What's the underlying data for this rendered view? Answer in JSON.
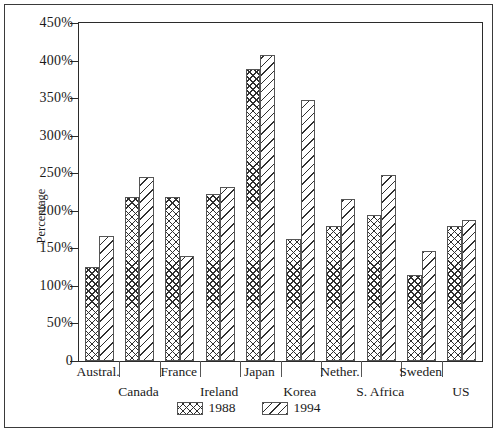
{
  "chart_data": {
    "type": "bar",
    "title": "",
    "xlabel": "",
    "ylabel": "Percentage",
    "ylim": [
      0,
      450
    ],
    "ytick_values": [
      0,
      50,
      100,
      150,
      200,
      250,
      300,
      350,
      400,
      450
    ],
    "ytick_labels": [
      "0",
      "50%",
      "100%",
      "150%",
      "200%",
      "250%",
      "300%",
      "350%",
      "400%",
      "450%"
    ],
    "grid": false,
    "legend_position": "bottom-center",
    "categories": [
      "Austral.",
      "Canada",
      "France",
      "Ireland",
      "Japan",
      "Korea",
      "Nether.",
      "S. Africa",
      "Sweden",
      "US"
    ],
    "series": [
      {
        "name": "1988",
        "hatch": "cross-hatch",
        "values": [
          125,
          219,
          219,
          222,
          389,
          162,
          180,
          194,
          114,
          180
        ]
      },
      {
        "name": "1994",
        "hatch": "diagonal-hatch",
        "values": [
          167,
          245,
          140,
          232,
          408,
          347,
          216,
          248,
          147,
          188
        ]
      }
    ]
  },
  "legend": {
    "items": [
      {
        "label": "1988",
        "swatch": "cross-hatch-swatch"
      },
      {
        "label": "1994",
        "swatch": "diagonal-hatch-swatch"
      }
    ]
  }
}
